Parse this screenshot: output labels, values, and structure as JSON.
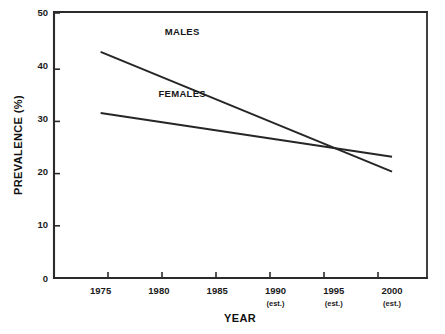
{
  "chart_data": {
    "type": "line",
    "title": "",
    "xlabel": "YEAR",
    "ylabel": "PREVALENCE  (%)",
    "x": [
      1975,
      2000
    ],
    "xlim": [
      1971,
      2003
    ],
    "ylim": [
      0,
      50
    ],
    "grid": false,
    "legend_position": "inline-labels",
    "x_ticks": [
      {
        "value": 1975,
        "label": "1975",
        "sublabel": ""
      },
      {
        "value": 1980,
        "label": "1980",
        "sublabel": ""
      },
      {
        "value": 1985,
        "label": "1985",
        "sublabel": ""
      },
      {
        "value": 1990,
        "label": "1990",
        "sublabel": "(est.)"
      },
      {
        "value": 1995,
        "label": "1995",
        "sublabel": "(est.)"
      },
      {
        "value": 2000,
        "label": "2000",
        "sublabel": "(est.)"
      }
    ],
    "y_ticks": [
      {
        "value": 0,
        "label": "0"
      },
      {
        "value": 10,
        "label": "10"
      },
      {
        "value": 20,
        "label": "20"
      },
      {
        "value": 30,
        "label": "30"
      },
      {
        "value": 40,
        "label": "40"
      },
      {
        "value": 50,
        "label": "50"
      }
    ],
    "series": [
      {
        "name": "MALES",
        "label": "MALES",
        "color": "#262626",
        "points": [
          {
            "x": 1975,
            "y": 42.5
          },
          {
            "x": 2000,
            "y": 20.0
          }
        ],
        "label_x": 1982.0,
        "label_y": 45.6
      },
      {
        "name": "FEMALES",
        "label": "FEMALES",
        "color": "#262626",
        "points": [
          {
            "x": 1975,
            "y": 31.0
          },
          {
            "x": 2000,
            "y": 22.8
          }
        ],
        "label_x": 1982.0,
        "label_y": 34.0
      }
    ],
    "annotations": [
      {
        "text": "lines cross near 1995 at about 24.5%",
        "x": 1995,
        "y": 24.5
      }
    ]
  },
  "figure": {
    "background_color": "#ffffff",
    "axis_color": "#2b2b2b"
  }
}
